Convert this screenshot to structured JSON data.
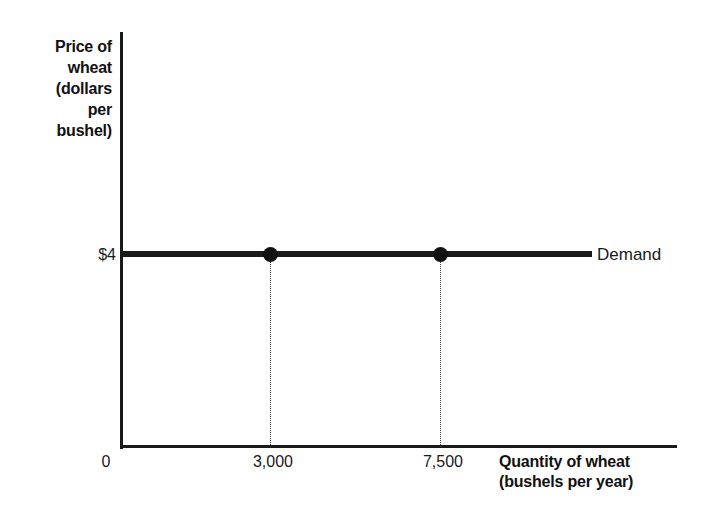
{
  "chart_data": {
    "type": "line",
    "title": "",
    "subtitle": "",
    "xlabel_line1": "Quantity of wheat",
    "xlabel_line2": "(bushels per year)",
    "ylabel_line1": "Price of",
    "ylabel_line2": "wheat",
    "ylabel_line3": "(dollars",
    "ylabel_line4": "per",
    "ylabel_line5": "bushel)",
    "x_tick_labels": [
      "0",
      "3,000",
      "7,500"
    ],
    "y_tick_labels": [
      "$4"
    ],
    "xlim": [
      0,
      9000
    ],
    "ylim": [
      0,
      8
    ],
    "grid": false,
    "legend_position": "right-of-line",
    "series": [
      {
        "name": "Demand",
        "x": [
          0,
          7500
        ],
        "values": [
          4,
          4
        ],
        "description": "Perfectly elastic (horizontal) demand curve at a price of $4 per bushel"
      }
    ],
    "points": [
      {
        "label": "3,000",
        "x": 3000,
        "y": 4
      },
      {
        "label": "7,500",
        "x": 7500,
        "y": 4
      }
    ],
    "annotations": [
      {
        "name": "demand-label",
        "text": "Demand"
      }
    ],
    "colors": {
      "line": "#1a1a1a",
      "marker": "#111111",
      "axis": "#1a1a1a",
      "dropline": "#3a3a3a",
      "background": "#ffffff"
    }
  }
}
